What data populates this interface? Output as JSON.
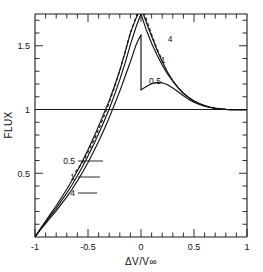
{
  "figure": {
    "title": "",
    "background_color": "#ffffff",
    "ink_color": "#111111"
  },
  "axes": {
    "x_label": "ΔV/V∞",
    "y_label": "FLUX",
    "x_ticks": [
      "-1",
      "-0.5",
      "0",
      "0.5",
      "1"
    ],
    "y_ticks": [
      "1.5",
      "1",
      "0.5"
    ]
  },
  "curve_labels": {
    "upper": [
      {
        "text": "4"
      },
      {
        "text": "1"
      },
      {
        "text": "0.5"
      }
    ],
    "lower": [
      {
        "text": "0.5"
      },
      {
        "text": "1"
      },
      {
        "text": "4"
      }
    ]
  },
  "chart_data": {
    "type": "line",
    "title": "",
    "xlabel": "ΔV/V∞",
    "ylabel": "FLUX",
    "xlim": [
      -1,
      1
    ],
    "ylim": [
      0,
      1.75
    ],
    "x_ticks": [
      -1,
      -0.5,
      0,
      0.5,
      1
    ],
    "x_tick_labels": [
      "-1",
      "-0.5",
      "0",
      "0.5",
      "1"
    ],
    "y_ticks": [
      0.5,
      1.0,
      1.5
    ],
    "y_tick_labels": [
      "0.5",
      "1",
      "1.5"
    ],
    "x_minor_tick_step": 0.1,
    "y_minor_tick_step": 0.1,
    "grid": false,
    "legend_position": "inline-annotations",
    "reference_lines": [
      {
        "orientation": "horizontal",
        "value": 1.0,
        "style": "solid"
      }
    ],
    "series": [
      {
        "name": "0.5",
        "style": "solid",
        "label_upper": "0.5",
        "label_lower": "0.5",
        "discontinuity_at_x": 0.0,
        "peak_value": 1.585,
        "x": [
          -1.0,
          -0.95,
          -0.9,
          -0.85,
          -0.8,
          -0.75,
          -0.7,
          -0.65,
          -0.6,
          -0.55,
          -0.5,
          -0.45,
          -0.4,
          -0.35,
          -0.3,
          -0.25,
          -0.2,
          -0.15,
          -0.1,
          -0.05,
          -0.02,
          0.0
        ],
        "y": [
          0.0,
          0.055,
          0.105,
          0.155,
          0.205,
          0.26,
          0.315,
          0.375,
          0.44,
          0.51,
          0.585,
          0.665,
          0.75,
          0.84,
          0.935,
          1.04,
          1.145,
          1.26,
          1.375,
          1.5,
          1.555,
          1.585
        ]
      },
      {
        "name": "0.5-post",
        "style": "solid",
        "parent": "0.5",
        "x": [
          0.0,
          0.04,
          0.08,
          0.12,
          0.16,
          0.2,
          0.25,
          0.3,
          0.35,
          0.4,
          0.45,
          0.5,
          0.55,
          0.6,
          0.65,
          0.7,
          0.75,
          0.8,
          0.85,
          0.9,
          1.0
        ],
        "y": [
          1.155,
          1.175,
          1.195,
          1.208,
          1.213,
          1.21,
          1.195,
          1.17,
          1.14,
          1.108,
          1.08,
          1.058,
          1.04,
          1.027,
          1.017,
          1.009,
          1.004,
          1.001,
          1.0,
          1.0,
          1.0
        ]
      },
      {
        "name": "1",
        "style": "solid",
        "label_upper": "1",
        "label_lower": "1",
        "peak_value": 1.75,
        "x": [
          -1.0,
          -0.95,
          -0.9,
          -0.85,
          -0.8,
          -0.75,
          -0.7,
          -0.65,
          -0.6,
          -0.55,
          -0.5,
          -0.45,
          -0.4,
          -0.35,
          -0.3,
          -0.25,
          -0.2,
          -0.15,
          -0.1,
          -0.05,
          0.0
        ],
        "y": [
          0.0,
          0.06,
          0.115,
          0.17,
          0.225,
          0.285,
          0.345,
          0.41,
          0.48,
          0.555,
          0.635,
          0.72,
          0.81,
          0.905,
          1.005,
          1.115,
          1.235,
          1.365,
          1.51,
          1.64,
          1.75
        ]
      },
      {
        "name": "1-post",
        "style": "solid",
        "parent": "1",
        "x": [
          0.0,
          0.05,
          0.1,
          0.15,
          0.2,
          0.25,
          0.3,
          0.35,
          0.4,
          0.45,
          0.5,
          0.55,
          0.6,
          0.65,
          0.7,
          0.75,
          0.8,
          0.85,
          0.9,
          1.0
        ],
        "y": [
          1.75,
          1.625,
          1.52,
          1.43,
          1.35,
          1.28,
          1.222,
          1.17,
          1.128,
          1.095,
          1.068,
          1.047,
          1.031,
          1.019,
          1.011,
          1.005,
          1.002,
          1.0,
          1.0,
          1.0
        ]
      },
      {
        "name": "4",
        "style": "solid",
        "label_upper": "4",
        "label_lower": "4",
        "peak_value": 1.8,
        "x": [
          -1.0,
          -0.95,
          -0.9,
          -0.85,
          -0.8,
          -0.75,
          -0.7,
          -0.65,
          -0.6,
          -0.55,
          -0.5,
          -0.45,
          -0.4,
          -0.35,
          -0.3,
          -0.25,
          -0.2,
          -0.15,
          -0.1,
          -0.05,
          0.0
        ],
        "y": [
          0.0,
          0.065,
          0.125,
          0.185,
          0.245,
          0.31,
          0.375,
          0.445,
          0.52,
          0.6,
          0.685,
          0.775,
          0.87,
          0.97,
          1.07,
          1.185,
          1.31,
          1.45,
          1.6,
          1.71,
          1.8
        ]
      },
      {
        "name": "4-post",
        "style": "solid",
        "parent": "4",
        "x": [
          0.0,
          0.05,
          0.1,
          0.15,
          0.2,
          0.25,
          0.3,
          0.35,
          0.4,
          0.45,
          0.5,
          0.55,
          0.6,
          0.65,
          0.7,
          0.75,
          0.8,
          0.85,
          0.9,
          1.0
        ],
        "y": [
          1.8,
          1.685,
          1.575,
          1.47,
          1.378,
          1.295,
          1.228,
          1.172,
          1.128,
          1.094,
          1.067,
          1.046,
          1.03,
          1.018,
          1.01,
          1.005,
          1.002,
          1.0,
          1.0,
          1.0
        ]
      },
      {
        "name": "dashed-envelope",
        "style": "dashed",
        "x": [
          -0.62,
          -0.55,
          -0.5,
          -0.45,
          -0.4,
          -0.35,
          -0.3,
          -0.25,
          -0.2,
          -0.15,
          -0.1,
          -0.05,
          0.0,
          0.05,
          0.1,
          0.15,
          0.2
        ],
        "y": [
          0.51,
          0.585,
          0.665,
          0.75,
          0.845,
          0.945,
          1.055,
          1.175,
          1.305,
          1.45,
          1.605,
          1.72,
          1.83,
          1.71,
          1.59,
          1.48,
          1.385
        ]
      }
    ]
  }
}
